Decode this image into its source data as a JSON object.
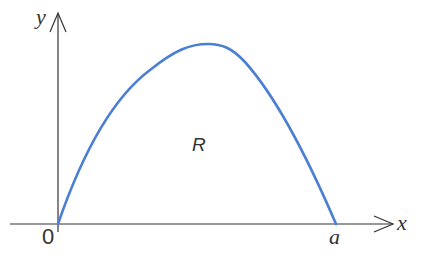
{
  "diagram": {
    "axes": {
      "x_label": "x",
      "y_label": "y",
      "origin_label": "0",
      "axis_color": "#333333"
    },
    "curve": {
      "color": "#4a7fd4",
      "description": "concave-down arch from origin to a",
      "end_label": "a"
    },
    "region_label": "R"
  }
}
